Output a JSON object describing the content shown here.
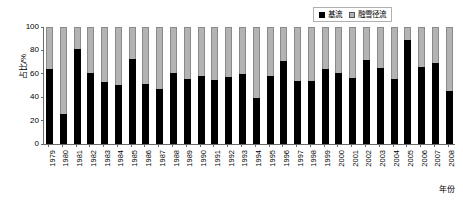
{
  "chart_data": {
    "type": "bar",
    "subtype": "stacked-100-percent",
    "title": "",
    "xlabel": "年份",
    "ylabel": "占比/%",
    "ylim": [
      0,
      100
    ],
    "yticks": [
      0,
      20,
      40,
      60,
      80,
      100
    ],
    "grid": false,
    "legend_position": "top-right",
    "categories": [
      "1979",
      "1980",
      "1981",
      "1982",
      "1983",
      "1984",
      "1985",
      "1986",
      "1987",
      "1988",
      "1989",
      "1990",
      "1991",
      "1992",
      "1993",
      "1994",
      "1995",
      "1996",
      "1997",
      "1998",
      "1999",
      "2000",
      "2001",
      "2002",
      "2003",
      "2004",
      "2005",
      "2006",
      "2007",
      "2008"
    ],
    "series": [
      {
        "name": "基流",
        "color": "#000000",
        "values": [
          64.0,
          25.5,
          81.5,
          60.5,
          53.0,
          50.5,
          72.5,
          51.0,
          47.0,
          61.0,
          55.5,
          58.0,
          54.5,
          57.0,
          59.5,
          39.0,
          58.0,
          71.0,
          53.5,
          53.5,
          64.5,
          60.5,
          56.0,
          71.5,
          65.0,
          55.5,
          89.0,
          66.0,
          69.5,
          45.5
        ]
      },
      {
        "name": "融雪径流",
        "color": "#b3b3b3",
        "values": [
          36.0,
          74.5,
          18.5,
          39.5,
          47.0,
          49.5,
          27.5,
          49.0,
          53.0,
          39.0,
          44.5,
          42.0,
          45.5,
          43.0,
          40.5,
          61.0,
          42.0,
          29.0,
          46.5,
          46.5,
          35.5,
          39.5,
          44.0,
          28.5,
          35.0,
          44.5,
          11.0,
          34.0,
          30.5,
          54.5
        ]
      }
    ]
  }
}
